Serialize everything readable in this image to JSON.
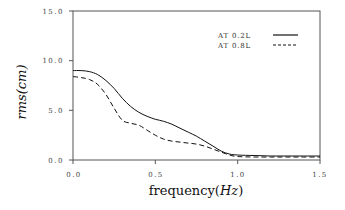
{
  "chart_data": {
    "type": "line",
    "title": "",
    "xlabel": "frequency(Hz)",
    "ylabel": "rms(cm)",
    "xlim": [
      0.0,
      1.5
    ],
    "ylim": [
      0.0,
      15.0
    ],
    "xticks": [
      "0.0",
      "0.5",
      "1.0",
      "1.5"
    ],
    "yticks": [
      "0.0",
      "5.0",
      "10.0",
      "15.0"
    ],
    "grid": false,
    "legend_position": "upper right",
    "series": [
      {
        "name": "AT 0.2L",
        "style": "solid",
        "x": [
          0.0,
          0.05,
          0.1,
          0.15,
          0.2,
          0.25,
          0.3,
          0.35,
          0.4,
          0.45,
          0.5,
          0.55,
          0.6,
          0.65,
          0.7,
          0.75,
          0.8,
          0.85,
          0.9,
          0.95,
          1.0,
          1.1,
          1.2,
          1.3,
          1.4,
          1.5
        ],
        "values": [
          9.0,
          9.0,
          8.9,
          8.6,
          8.0,
          7.2,
          6.2,
          5.4,
          4.8,
          4.4,
          4.1,
          3.9,
          3.6,
          3.2,
          2.8,
          2.4,
          1.9,
          1.4,
          0.9,
          0.6,
          0.5,
          0.45,
          0.4,
          0.4,
          0.4,
          0.4
        ]
      },
      {
        "name": "AT 0.8L",
        "style": "dashed",
        "x": [
          0.0,
          0.05,
          0.1,
          0.15,
          0.2,
          0.25,
          0.3,
          0.35,
          0.4,
          0.45,
          0.5,
          0.55,
          0.6,
          0.65,
          0.7,
          0.75,
          0.8,
          0.85,
          0.9,
          0.95,
          1.0,
          1.1,
          1.2,
          1.3,
          1.4,
          1.5
        ],
        "values": [
          8.4,
          8.3,
          8.1,
          7.6,
          6.6,
          5.2,
          4.0,
          3.7,
          3.5,
          3.0,
          2.5,
          2.1,
          1.9,
          1.8,
          1.7,
          1.6,
          1.4,
          1.1,
          0.8,
          0.5,
          0.35,
          0.3,
          0.3,
          0.3,
          0.3,
          0.3
        ]
      }
    ]
  },
  "labels": {
    "y_ticks": [
      "0.0",
      "5.0",
      "10.0",
      "15.0"
    ],
    "x_ticks": [
      "0.0",
      "0.5",
      "1.0",
      "1.5"
    ],
    "legend": [
      "AT 0.2L",
      "AT 0.8L"
    ]
  }
}
